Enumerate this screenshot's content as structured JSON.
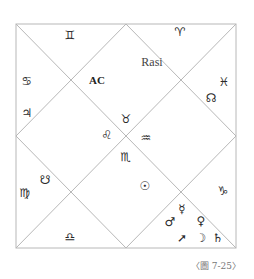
{
  "chart": {
    "title": "Rasi",
    "ascendant_label": "AC",
    "line_color": "#b8b8b8",
    "square": {
      "x1": 16,
      "y1": 24,
      "x2": 236,
      "y2": 248
    }
  },
  "houses": {
    "top_left_triangle": {
      "sign": "♊",
      "sign_name": "Gemini"
    },
    "top_right_triangle": {
      "sign": "♈",
      "sign_name": "Aries"
    },
    "left_upper_triangle": {
      "sign": "♋",
      "sign_name": "Cancer",
      "planets": [
        "♃"
      ],
      "planet_names": [
        "Jupiter"
      ]
    },
    "right_upper_triangle": {
      "sign": "♓",
      "sign_name": "Pisces",
      "planets": [
        "☊"
      ],
      "planet_names": [
        "North Node"
      ]
    },
    "top_diamond": {
      "sign": "♉",
      "sign_name": "Taurus",
      "label": "AC"
    },
    "left_diamond": {
      "sign": "♌",
      "sign_name": "Leo"
    },
    "right_diamond": {
      "sign": "♒",
      "sign_name": "Aquarius"
    },
    "bottom_diamond": {
      "sign": "♏",
      "sign_name": "Scorpio",
      "planets": [
        "☉"
      ],
      "planet_names": [
        "Sun"
      ]
    },
    "left_lower_triangle": {
      "sign": "♍",
      "sign_name": "Virgo",
      "planets": [
        "☋"
      ],
      "planet_names": [
        "South Node"
      ]
    },
    "right_lower_triangle": {
      "sign": "♑",
      "sign_name": "Capricorn"
    },
    "bottom_right_triangle": {
      "sign": "♐",
      "sign_name": "Sagittarius",
      "planets": [
        "☿",
        "♂",
        "♀",
        "☽",
        "♄"
      ],
      "planet_names": [
        "Mercury",
        "Mars",
        "Venus",
        "Moon",
        "Saturn"
      ]
    },
    "bottom_left_triangle": {
      "sign": "♎",
      "sign_name": "Libra"
    }
  },
  "glyphs": {
    "gemini": "♊",
    "aries": "♈",
    "cancer": "♋",
    "jupiter": "♃",
    "pisces": "♓",
    "north_node": "☊",
    "taurus": "♉",
    "leo": "♌",
    "aquarius": "♒",
    "scorpio": "♏",
    "virgo": "♍",
    "south_node": "☋",
    "sun": "☉",
    "capricorn": "♑",
    "mercury": "☿",
    "mars": "♂",
    "venus": "♀",
    "sagittarius_arrow": "➚",
    "moon": "☽",
    "saturn": "♄",
    "libra": "♎"
  },
  "caption": "〈圖 7-25〉"
}
